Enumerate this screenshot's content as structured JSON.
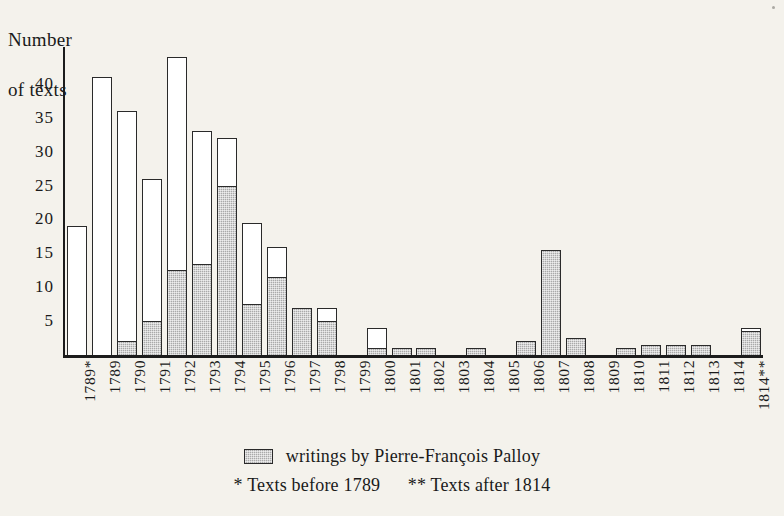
{
  "figure": {
    "background_color": "#f4f2ec",
    "ink_color": "#1a1a1a"
  },
  "axis_title": {
    "line1": "Number",
    "line2": "of texts"
  },
  "legend": {
    "series_label": "writings by Pierre-François Palloy",
    "note_before": "* Texts before 1789",
    "note_after": "** Texts after 1814",
    "swatch_name": "hatched-gray-swatch"
  },
  "chart_data": {
    "type": "bar",
    "title": "",
    "subtitle": "",
    "xlabel": "",
    "ylabel": "Number of texts",
    "ylim": [
      0,
      45
    ],
    "yticks": [
      5,
      10,
      15,
      20,
      25,
      30,
      35,
      40
    ],
    "ytick_labels": [
      "5",
      "10",
      "15",
      "20",
      "25",
      "30",
      "35",
      "40"
    ],
    "grid": false,
    "stacked": true,
    "legend_position": "bottom-center",
    "bar_fill_hatch_color": "#a9a9a9",
    "bar_fill_plain_color": "#ffffff",
    "bar_edge_color": "#2a2a2a",
    "categories": [
      "1789*",
      "1789",
      "1790",
      "1791",
      "1792",
      "1793",
      "1794",
      "1795",
      "1796",
      "1797",
      "1798",
      "1799",
      "1800",
      "1801",
      "1802",
      "1803",
      "1804",
      "1805",
      "1806",
      "1807",
      "1808",
      "1809",
      "1810",
      "1811",
      "1812",
      "1813",
      "1814",
      "1814**"
    ],
    "series": [
      {
        "name": "writings by Pierre-François Palloy",
        "fill": "hatched",
        "values": [
          0,
          0,
          2,
          5,
          12.5,
          13.5,
          25,
          7.5,
          11.5,
          7,
          5,
          0,
          1,
          1,
          1,
          0,
          1,
          0,
          2,
          15.5,
          2.5,
          0,
          1,
          1.5,
          1.5,
          1.5,
          0,
          3.5
        ]
      },
      {
        "name": "other texts",
        "fill": "white",
        "values": [
          19,
          41,
          34,
          21,
          31.5,
          19.5,
          7,
          12,
          4.5,
          0,
          2,
          0,
          3,
          0,
          0,
          0,
          0,
          0,
          0,
          0,
          0,
          0,
          0,
          0,
          0,
          0,
          0,
          0.5
        ]
      }
    ],
    "totals": [
      19,
      41,
      36,
      26,
      44,
      33,
      32,
      19.5,
      16,
      7,
      7,
      0,
      4,
      1,
      1,
      0,
      1,
      0,
      2,
      15.5,
      2.5,
      0,
      1,
      1.5,
      1.5,
      1.5,
      0,
      4
    ],
    "annotations": [
      "* Texts before 1789",
      "** Texts after 1814"
    ]
  }
}
